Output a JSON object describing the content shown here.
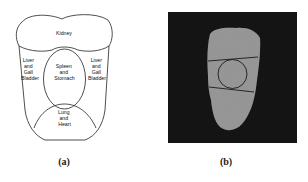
{
  "figure": {
    "panel_a": {
      "caption": "(a)",
      "regions": [
        {
          "id": "kidney",
          "lines": [
            "Kidney"
          ]
        },
        {
          "id": "liver-left",
          "lines": [
            "Liver",
            "and",
            "Gall",
            "Bladder"
          ]
        },
        {
          "id": "spleen",
          "lines": [
            "Spleen",
            "and",
            "Stomach"
          ]
        },
        {
          "id": "liver-right",
          "lines": [
            "Liver",
            "and",
            "Gall",
            "Bladder"
          ]
        },
        {
          "id": "lung",
          "lines": [
            "Lung",
            "and",
            "Heart"
          ]
        }
      ]
    },
    "panel_b": {
      "caption": "(b)",
      "background_color": "#141414",
      "tongue_color": "#9a9a9a"
    }
  }
}
